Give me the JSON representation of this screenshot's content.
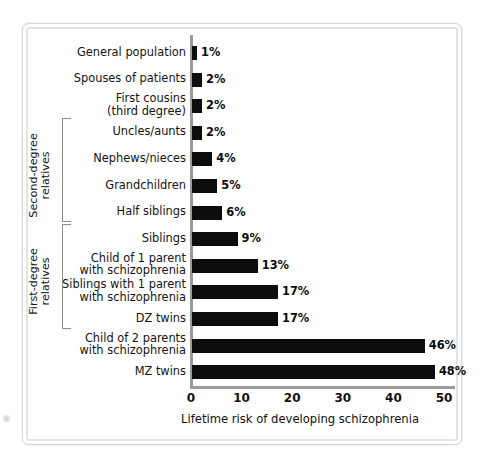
{
  "chart_data": {
    "type": "bar",
    "orientation": "horizontal",
    "title": "",
    "xlabel": "Lifetime risk of developing schizophrenia",
    "ylabel": "",
    "xlim": [
      0,
      50
    ],
    "xticks": [
      0,
      10,
      20,
      30,
      40,
      50
    ],
    "grid": false,
    "legend": null,
    "value_suffix": "%",
    "bar_color": "#0d0d0d",
    "axis_color": "#9a9a9a",
    "categories": [
      "General population",
      "Spouses of patients",
      "First cousins\n(third degree)",
      "Uncles/aunts",
      "Nephews/nieces",
      "Grandchildren",
      "Half siblings",
      "Siblings",
      "Child of 1 parent\nwith schizophrenia",
      "Siblings with 1 parent\nwith schizophrenia",
      "DZ twins",
      "Child of 2 parents\nwith schizophrenia",
      "MZ twins"
    ],
    "values": [
      1,
      2,
      2,
      2,
      4,
      5,
      6,
      9,
      13,
      17,
      17,
      46,
      48
    ],
    "value_labels": [
      "1%",
      "2%",
      "2%",
      "2%",
      "4%",
      "5%",
      "6%",
      "9%",
      "13%",
      "17%",
      "17%",
      "46%",
      "48%"
    ],
    "groups": [
      {
        "label": "Second-degree\nrelatives",
        "from_index": 3,
        "to_index": 6
      },
      {
        "label": "First-degree\nrelatives",
        "from_index": 7,
        "to_index": 10
      }
    ]
  }
}
